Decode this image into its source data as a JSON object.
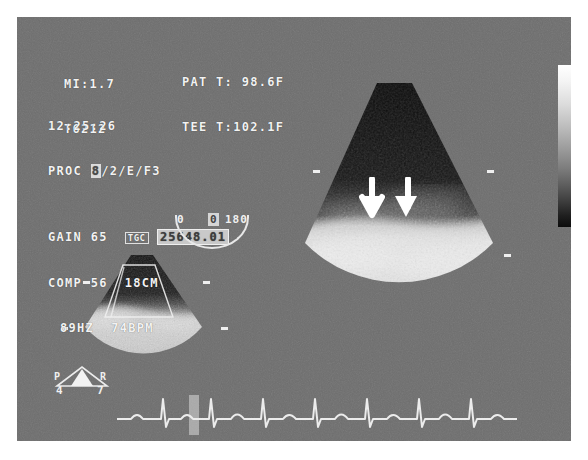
{
  "modality": {
    "name": "transesophageal-echocardiography",
    "panel_bg": "#6e6e6e",
    "text_color": "#f2f2f2"
  },
  "header": {
    "mechanical_index_label": "MI:1.7",
    "probe_id": "T6212",
    "patient_temp": "PAT T: 98.6F",
    "tee_temp": "TEE T:102.1F",
    "timestamp": "12:25:26",
    "proc_prefix": "PROC ",
    "proc_highlight": "8",
    "proc_rest": "/2/E/F3"
  },
  "acquisition": {
    "gain_label": "GAIN",
    "gain_value": "65",
    "tgc_tag": "TGC",
    "id_field": "25648.01",
    "comp_label": "COMP",
    "comp_value": "56",
    "depth": "18CM",
    "frame_rate": "89HZ",
    "heart_rate": "74BPM"
  },
  "rotation_gauge": {
    "name": "probe-rotation-gauge",
    "left_label": "0",
    "right_label": "180",
    "current_angle": "0"
  },
  "probe_orientation": {
    "posterior_label": "P",
    "right_label": "R",
    "left_value": "4",
    "right_value": "7"
  },
  "grayscale_bar": {
    "name": "grayscale-map",
    "top": "#ffffff",
    "bottom": "#0c0c0c"
  },
  "annotations": {
    "arrow_1": "↙",
    "arrow_2": "↙",
    "arrow_count": "2",
    "arrow_color": "#ffffff",
    "description": "paired arrows marking bright tissue interface"
  },
  "views": {
    "main_view_name": "primary-sector-scan",
    "secondary_view_name": "reference-sector-scan",
    "roi_name": "region-of-interest-trapezoid"
  },
  "ecg": {
    "name": "ecg-trace",
    "beats": "5",
    "marker_label": ""
  }
}
